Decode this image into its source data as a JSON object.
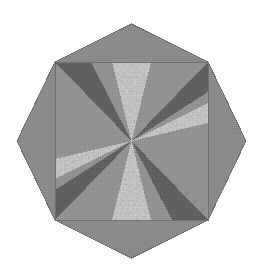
{
  "artwork": {
    "title": "Eight Point Star Quilt Block",
    "type": "geometric-textile-pattern",
    "background_color": "#ffffff",
    "canvas": {
      "width": 258,
      "height": 276
    }
  },
  "palette": {
    "medium_gray": "#8a8a8a",
    "medium_gray_alt": "#909090",
    "dark_gray": "#5e5e5e",
    "speckle_base": "#9a9a9a",
    "speckle_dark": "#636363",
    "speckle_light": "#c4c4c4",
    "outline": "#6f6f6f",
    "weave_line": "#7e7e7e"
  },
  "geometry": {
    "center": {
      "x": 131.5,
      "y": 141.0
    },
    "square": {
      "left": 55,
      "top": 62,
      "right": 208,
      "bottom": 220
    },
    "star_points": {
      "top": {
        "x": 131.5,
        "y": 24
      },
      "right": {
        "x": 246,
        "y": 141
      },
      "bottom": {
        "x": 131.5,
        "y": 258
      },
      "left": {
        "x": 17,
        "y": 141
      }
    }
  },
  "components": {
    "outer_points": [
      {
        "name": "north-diamond-point",
        "fill": "medium_gray"
      },
      {
        "name": "east-diamond-point",
        "fill": "medium_gray"
      },
      {
        "name": "south-diamond-point",
        "fill": "medium_gray"
      },
      {
        "name": "west-diamond-point",
        "fill": "medium_gray"
      }
    ],
    "pinwheel_wedges": [
      {
        "name": "wedge-north-speckle",
        "fill": "speckle",
        "direction": "north"
      },
      {
        "name": "wedge-east-speckle",
        "fill": "speckle",
        "direction": "east"
      },
      {
        "name": "wedge-south-speckle",
        "fill": "speckle",
        "direction": "south"
      },
      {
        "name": "wedge-west-speckle",
        "fill": "speckle",
        "direction": "west"
      },
      {
        "name": "wedge-northeast-dark",
        "fill": "dark_gray",
        "direction": "northeast"
      },
      {
        "name": "wedge-southeast-dark",
        "fill": "dark_gray",
        "direction": "southeast"
      },
      {
        "name": "wedge-southwest-dark",
        "fill": "dark_gray",
        "direction": "southwest"
      },
      {
        "name": "wedge-northwest-dark",
        "fill": "dark_gray",
        "direction": "northwest"
      },
      {
        "name": "wedge-nne-medium",
        "fill": "medium_gray",
        "direction": "north-northeast"
      },
      {
        "name": "wedge-ene-medium",
        "fill": "medium_gray",
        "direction": "east-northeast"
      },
      {
        "name": "wedge-ese-medium",
        "fill": "medium_gray",
        "direction": "east-southeast"
      },
      {
        "name": "wedge-sse-medium",
        "fill": "medium_gray",
        "direction": "south-southeast"
      },
      {
        "name": "wedge-ssw-medium",
        "fill": "medium_gray",
        "direction": "south-southwest"
      },
      {
        "name": "wedge-wsw-medium",
        "fill": "medium_gray",
        "direction": "west-southwest"
      },
      {
        "name": "wedge-wnw-medium",
        "fill": "medium_gray",
        "direction": "west-northwest"
      },
      {
        "name": "wedge-nnw-medium",
        "fill": "medium_gray",
        "direction": "north-northwest"
      }
    ]
  },
  "labels": {
    "figure_caption": "Eight Point Star Quilt Block"
  }
}
